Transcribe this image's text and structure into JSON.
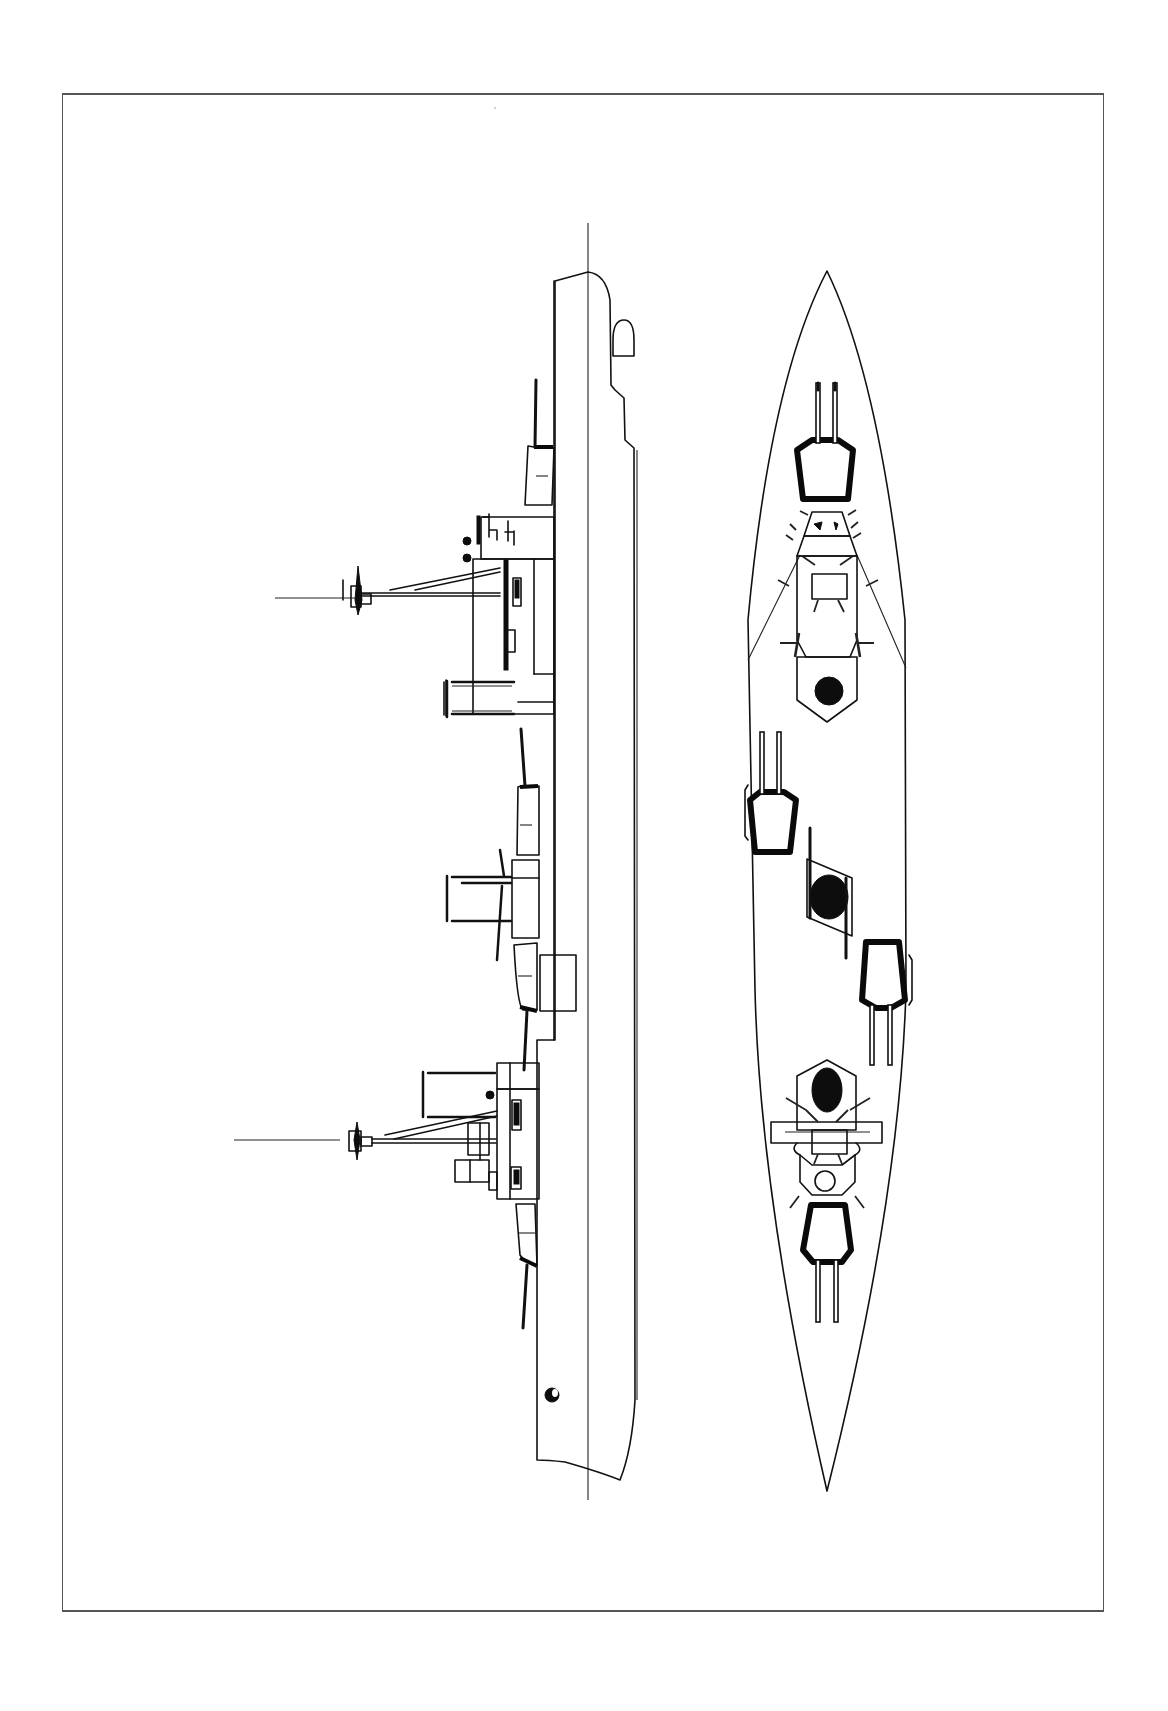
{
  "document": {
    "type": "naval line drawing",
    "views": [
      "side-profile",
      "plan-view"
    ],
    "text_labels": []
  },
  "colors": {
    "background": "#ffffff",
    "ink": "#111111",
    "frame": "#555555"
  },
  "side_profile": {
    "main_turrets": 5,
    "masts": 2,
    "funnels": 3
  },
  "plan_view": {
    "main_turrets": 5,
    "funnels": 3
  }
}
